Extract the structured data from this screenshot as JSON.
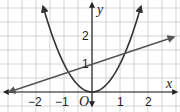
{
  "chart_data": {
    "type": "line",
    "title": "",
    "xlabel": "x",
    "ylabel": "y",
    "origin_label": "O",
    "xlim": [
      -3.1,
      3.0
    ],
    "ylim": [
      -0.5,
      3.3
    ],
    "grid": true,
    "grid_step": 0.5,
    "x_tick_labels": [
      {
        "value": -2,
        "label": "−2"
      },
      {
        "value": -1,
        "label": "−1"
      },
      {
        "value": 1,
        "label": "1"
      },
      {
        "value": 2,
        "label": "2"
      }
    ],
    "y_tick_labels": [
      {
        "value": 1,
        "label": "1"
      },
      {
        "value": 2,
        "label": "2"
      }
    ],
    "series": [
      {
        "name": "parabola",
        "equation": "y = x^2",
        "points": [
          [
            -1.75,
            3.06
          ],
          [
            -1.5,
            2.25
          ],
          [
            -1,
            1
          ],
          [
            -0.5,
            0.25
          ],
          [
            0,
            0
          ],
          [
            0.5,
            0.25
          ],
          [
            1,
            1
          ],
          [
            1.5,
            2.25
          ],
          [
            1.75,
            3.06
          ]
        ],
        "color": "#333333",
        "arrows": "both"
      },
      {
        "name": "line",
        "equation": "y = x/3 + 1",
        "points": [
          [
            -3,
            0
          ],
          [
            0,
            1
          ],
          [
            3,
            2
          ]
        ],
        "color": "#555555",
        "arrows": "both"
      }
    ],
    "intersections": [
      [
        -0.85,
        0.72
      ],
      [
        1.18,
        1.39
      ]
    ]
  },
  "colors": {
    "grid": "#c8c8c8",
    "axis": "#222222",
    "parabola": "#333333",
    "line": "#555555"
  }
}
